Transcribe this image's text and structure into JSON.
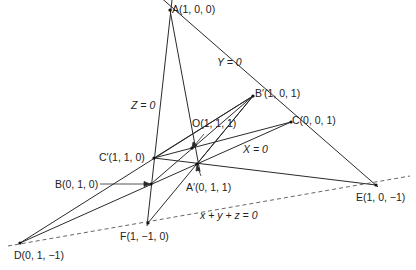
{
  "diagram": {
    "points": {
      "A": {
        "label": "A(1, 0, 0)",
        "x": 170,
        "y": 10
      },
      "Bp": {
        "label": "B′(1, 0, 1)",
        "x": 253,
        "y": 96
      },
      "C": {
        "label": "C(0, 0, 1)",
        "x": 291,
        "y": 122
      },
      "E": {
        "label": "E(1, 0, −1)",
        "x": 376,
        "y": 185
      },
      "Cp": {
        "label": "C′(1, 1, 0)",
        "x": 154,
        "y": 158
      },
      "O": {
        "label": "O(1, 1, 1)",
        "x": 192,
        "y": 148
      },
      "Ap": {
        "label": "A′(0, 1, 1)",
        "x": 197,
        "y": 164
      },
      "B": {
        "label": "B(0, 1, 0)",
        "x": 151,
        "y": 184
      },
      "F": {
        "label": "F(1, −1, 0)",
        "x": 148,
        "y": 223
      },
      "D": {
        "label": "D(0, 1, −1)",
        "x": 20,
        "y": 243
      }
    },
    "line_labels": {
      "Y": "Y = 0",
      "Z": "Z = 0",
      "X": "X = 0",
      "xyz": "x + y + z = 0"
    }
  }
}
